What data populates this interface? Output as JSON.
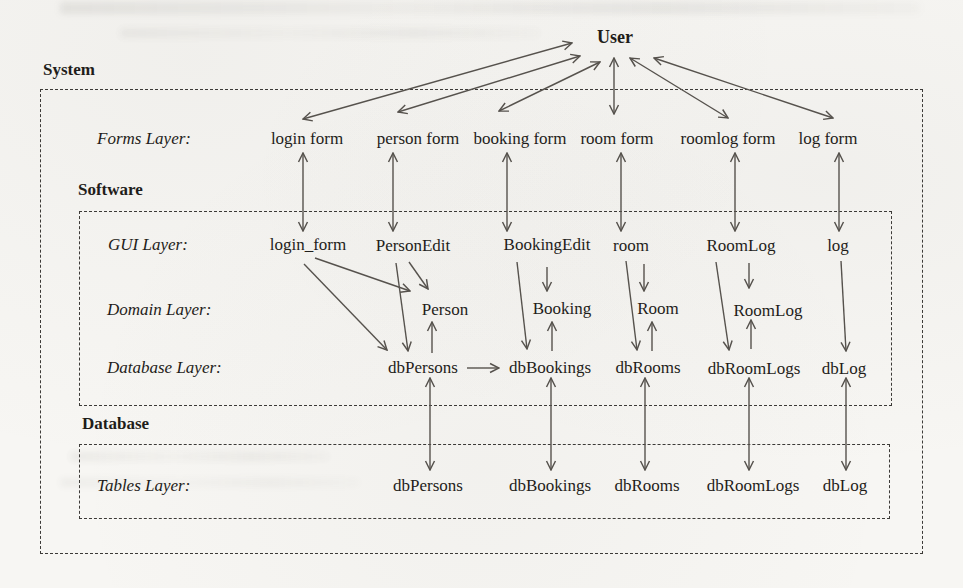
{
  "user_label": "User",
  "boxes": {
    "system": "System",
    "software": "Software",
    "database": "Database"
  },
  "layers": {
    "forms": {
      "label": "Forms Layer:",
      "nodes": [
        "login form",
        "person form",
        "booking form",
        "room form",
        "roomlog form",
        "log form"
      ]
    },
    "gui": {
      "label": "GUI Layer:",
      "nodes": [
        "login_form",
        "PersonEdit",
        "BookingEdit",
        "room",
        "RoomLog",
        "log"
      ]
    },
    "domain": {
      "label": "Domain Layer:",
      "nodes": [
        "Person",
        "Booking",
        "Room",
        "RoomLog"
      ]
    },
    "database": {
      "label": "Database Layer:",
      "nodes": [
        "dbPersons",
        "dbBookings",
        "dbRooms",
        "dbRoomLogs",
        "dbLog"
      ]
    },
    "tables": {
      "label": "Tables Layer:",
      "nodes": [
        "dbPersons",
        "dbBookings",
        "dbRooms",
        "dbRoomLogs",
        "dbLog"
      ]
    }
  },
  "colors": {
    "ink": "#1f1d1a",
    "arrow": "#56524d",
    "dash": "#3c3a37",
    "paper": "#f7f6f3"
  },
  "edges": [
    {
      "from": "user",
      "to": "login-form",
      "heads": "both",
      "x1": 572,
      "y1": 43,
      "x2": 303,
      "y2": 119
    },
    {
      "from": "user",
      "to": "person-form",
      "heads": "both",
      "x1": 580,
      "y1": 56,
      "x2": 398,
      "y2": 112
    },
    {
      "from": "user",
      "to": "booking-form",
      "heads": "both",
      "x1": 600,
      "y1": 62,
      "x2": 499,
      "y2": 111
    },
    {
      "from": "user",
      "to": "room-form",
      "heads": "both",
      "x1": 614,
      "y1": 58,
      "x2": 614,
      "y2": 114
    },
    {
      "from": "user",
      "to": "roomlog-form",
      "heads": "both",
      "x1": 630,
      "y1": 58,
      "x2": 728,
      "y2": 118
    },
    {
      "from": "user",
      "to": "log-form",
      "heads": "both",
      "x1": 654,
      "y1": 58,
      "x2": 833,
      "y2": 118
    },
    {
      "from": "login-form",
      "to": "login_form",
      "heads": "both",
      "x1": 303,
      "y1": 153,
      "x2": 303,
      "y2": 231
    },
    {
      "from": "person-form",
      "to": "PersonEdit",
      "heads": "both",
      "x1": 393,
      "y1": 153,
      "x2": 393,
      "y2": 231
    },
    {
      "from": "booking-form",
      "to": "BookingEdit",
      "heads": "both",
      "x1": 507,
      "y1": 153,
      "x2": 507,
      "y2": 231
    },
    {
      "from": "room-form",
      "to": "room",
      "heads": "both",
      "x1": 621,
      "y1": 153,
      "x2": 621,
      "y2": 231
    },
    {
      "from": "roomlog-form",
      "to": "RoomLog-gui",
      "heads": "both",
      "x1": 735,
      "y1": 153,
      "x2": 735,
      "y2": 231
    },
    {
      "from": "log-form",
      "to": "log",
      "heads": "both",
      "x1": 839,
      "y1": 153,
      "x2": 839,
      "y2": 231
    },
    {
      "from": "login_form",
      "to": "Person",
      "heads": "end",
      "x1": 315,
      "y1": 258,
      "x2": 410,
      "y2": 291
    },
    {
      "from": "login_form",
      "to": "dbPersons",
      "heads": "end",
      "x1": 304,
      "y1": 264,
      "x2": 387,
      "y2": 350
    },
    {
      "from": "PersonEdit",
      "to": "Person",
      "heads": "end",
      "x1": 409,
      "y1": 262,
      "x2": 428,
      "y2": 289
    },
    {
      "from": "PersonEdit",
      "to": "dbPersons",
      "heads": "end",
      "x1": 396,
      "y1": 263,
      "x2": 408,
      "y2": 351
    },
    {
      "from": "BookingEdit",
      "to": "Booking",
      "heads": "end",
      "x1": 547,
      "y1": 267,
      "x2": 547,
      "y2": 291
    },
    {
      "from": "BookingEdit",
      "to": "dbBookings",
      "heads": "end",
      "x1": 517,
      "y1": 262,
      "x2": 527,
      "y2": 349
    },
    {
      "from": "room",
      "to": "Room",
      "heads": "end",
      "x1": 644,
      "y1": 264,
      "x2": 644,
      "y2": 291
    },
    {
      "from": "room",
      "to": "dbRooms",
      "heads": "end",
      "x1": 626,
      "y1": 261,
      "x2": 637,
      "y2": 350
    },
    {
      "from": "RoomLog-gui",
      "to": "RoomLog",
      "heads": "end",
      "x1": 749,
      "y1": 263,
      "x2": 749,
      "y2": 288
    },
    {
      "from": "RoomLog-gui",
      "to": "dbRoomLogs",
      "heads": "end",
      "x1": 716,
      "y1": 262,
      "x2": 729,
      "y2": 350
    },
    {
      "from": "log",
      "to": "dbLog",
      "heads": "end",
      "x1": 841,
      "y1": 261,
      "x2": 846,
      "y2": 351
    },
    {
      "from": "dbPersons",
      "to": "Person",
      "heads": "end",
      "x1": 432,
      "y1": 353,
      "x2": 432,
      "y2": 322
    },
    {
      "from": "dbBookings",
      "to": "Booking",
      "heads": "end",
      "x1": 552,
      "y1": 351,
      "x2": 552,
      "y2": 322
    },
    {
      "from": "dbRooms",
      "to": "Room",
      "heads": "end",
      "x1": 652,
      "y1": 351,
      "x2": 652,
      "y2": 322
    },
    {
      "from": "dbRoomLogs",
      "to": "RoomLog",
      "heads": "end",
      "x1": 751,
      "y1": 349,
      "x2": 751,
      "y2": 320
    },
    {
      "from": "dbPersons",
      "to": "dbBookings",
      "heads": "end",
      "x1": 467,
      "y1": 368,
      "x2": 499,
      "y2": 368
    },
    {
      "from": "dbPersons-db",
      "to": "dbPersons-table",
      "heads": "both",
      "x1": 430,
      "y1": 378,
      "x2": 430,
      "y2": 470
    },
    {
      "from": "dbBookings-db",
      "to": "dbBookings-table",
      "heads": "both",
      "x1": 551,
      "y1": 378,
      "x2": 551,
      "y2": 470
    },
    {
      "from": "dbRooms-db",
      "to": "dbRooms-table",
      "heads": "both",
      "x1": 645,
      "y1": 378,
      "x2": 645,
      "y2": 470
    },
    {
      "from": "dbRoomLogs-db",
      "to": "dbRoomLogs-table",
      "heads": "both",
      "x1": 749,
      "y1": 378,
      "x2": 749,
      "y2": 470
    },
    {
      "from": "dbLog-db",
      "to": "dbLog-table",
      "heads": "both",
      "x1": 846,
      "y1": 378,
      "x2": 846,
      "y2": 470
    }
  ]
}
